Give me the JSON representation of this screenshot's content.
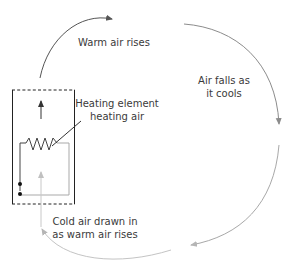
{
  "diagram": {
    "labels": {
      "warm_rises": "Warm air rises",
      "falls_line1": "Air falls as",
      "falls_line2": "it cools",
      "heating_line1": "Heating element",
      "heating_line2": "heating air",
      "cold_line1": "Cold air drawn in",
      "cold_line2": "as warm air rises"
    },
    "colors": {
      "warm_arrow": "#555555",
      "cool_arrow": "#9a9a9a",
      "cold_arrow": "#c4c4c4",
      "box": "#222222",
      "text": "#3a3a3a"
    }
  }
}
